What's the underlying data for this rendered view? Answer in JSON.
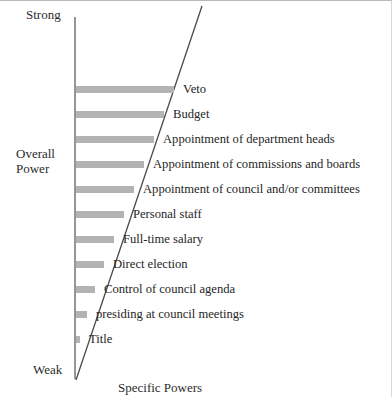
{
  "chart_data": {
    "type": "bar",
    "orientation": "horizontal",
    "title": "",
    "xlabel": "Specific Powers",
    "ylabel": "Overall Power",
    "y_axis_top_tick": "Strong",
    "y_axis_bottom_tick": "Weak",
    "grid": false,
    "legend": null,
    "bar_color": "#b3b3b3",
    "axis_color": "#555555",
    "categories": [
      "Veto",
      "Budget",
      "Appointment of department heads",
      "Appointment of commissions and boards",
      "Appointment of council and/or committees",
      "Personal staff",
      "Full-time salary",
      "Direct election",
      "Control of council agenda",
      "presiding at council meetings",
      "Title"
    ],
    "values": [
      98,
      90,
      81,
      72,
      63,
      54,
      45,
      36,
      27,
      18,
      9
    ],
    "value_note": "bar lengths decrease linearly from top (longest) to bottom (shortest), each terminating on the diagonal power line",
    "xlim": [
      0,
      100
    ],
    "ylim": [
      0,
      11
    ]
  },
  "axis_labels": {
    "strong": "Strong",
    "overall_line1": "Overall",
    "overall_line2": "Power",
    "weak": "Weak",
    "specific_powers": "Specific Powers"
  },
  "bars": [
    {
      "label": "Veto",
      "y": 89,
      "end_x": 174
    },
    {
      "label": "Budget",
      "y": 114,
      "end_x": 164
    },
    {
      "label": "Appointment of department heads",
      "y": 139,
      "end_x": 154
    },
    {
      "label": "Appointment of commissions and boards",
      "y": 164,
      "end_x": 144
    },
    {
      "label": "Appointment of council and/or committees",
      "y": 189,
      "end_x": 134
    },
    {
      "label": "Personal staff",
      "y": 214,
      "end_x": 124
    },
    {
      "label": "Full-time salary",
      "y": 239,
      "end_x": 114
    },
    {
      "label": "Direct election",
      "y": 264,
      "end_x": 104
    },
    {
      "label": "Control of council agenda",
      "y": 289,
      "end_x": 95
    },
    {
      "label": "presiding at council meetings",
      "y": 314,
      "end_x": 87
    },
    {
      "label": "Title",
      "y": 339,
      "end_x": 80
    }
  ]
}
